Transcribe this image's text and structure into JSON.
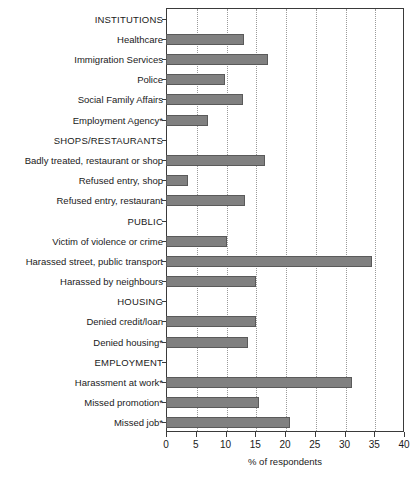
{
  "chart_data": {
    "type": "bar",
    "orientation": "horizontal",
    "title": "",
    "xlabel": "% of respondents",
    "ylabel": "",
    "xlim": [
      0,
      40
    ],
    "xticks": [
      0,
      5,
      10,
      15,
      20,
      25,
      30,
      35,
      40
    ],
    "grid": "vertical dotted gridlines at every 5 units",
    "legend": "none",
    "bar_color": "#808080",
    "rows": [
      {
        "label": "INSTITUTIONS",
        "is_group": true,
        "value": null
      },
      {
        "label": "Healthcare",
        "is_group": false,
        "value": 13.1
      },
      {
        "label": "Immigration Services",
        "is_group": false,
        "value": 17.1
      },
      {
        "label": "Police",
        "is_group": false,
        "value": 9.9
      },
      {
        "label": "Social Family Affairs",
        "is_group": false,
        "value": 12.9
      },
      {
        "label": "Employment Agency*",
        "is_group": false,
        "value": 7.0
      },
      {
        "label": "SHOPS/RESTAURANTS",
        "is_group": true,
        "value": null
      },
      {
        "label": "Badly treated, restaurant or shop",
        "is_group": false,
        "value": 16.6
      },
      {
        "label": "Refused entry, shop",
        "is_group": false,
        "value": 3.7
      },
      {
        "label": "Refused entry, restaurant",
        "is_group": false,
        "value": 13.3
      },
      {
        "label": "PUBLIC",
        "is_group": true,
        "value": null
      },
      {
        "label": "Victim of violence or crime",
        "is_group": false,
        "value": 10.2
      },
      {
        "label": "Harassed street, public transport",
        "is_group": false,
        "value": 34.6
      },
      {
        "label": "Harassed by neighbours",
        "is_group": false,
        "value": 15.1
      },
      {
        "label": "HOUSING",
        "is_group": true,
        "value": null
      },
      {
        "label": "Denied credit/loan",
        "is_group": false,
        "value": 15.1
      },
      {
        "label": "Denied housing*",
        "is_group": false,
        "value": 13.8
      },
      {
        "label": "EMPLOYMENT",
        "is_group": true,
        "value": null
      },
      {
        "label": "Harassment at work*",
        "is_group": false,
        "value": 31.2
      },
      {
        "label": "Missed promotion*",
        "is_group": false,
        "value": 15.6
      },
      {
        "label": "Missed job*",
        "is_group": false,
        "value": 20.8
      }
    ]
  }
}
